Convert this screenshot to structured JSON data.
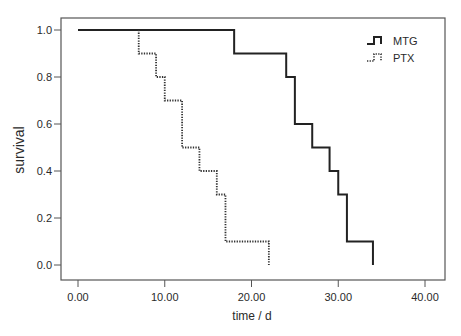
{
  "chart_data": {
    "type": "line",
    "subtype": "kaplan-meier-step",
    "title": "",
    "xlabel": "time / d",
    "ylabel": "survival",
    "xlim": [
      0,
      40
    ],
    "ylim": [
      0,
      1.0
    ],
    "x_ticks": [
      0,
      10,
      20,
      30,
      40
    ],
    "x_tick_labels": [
      "0.00",
      "10.00",
      "20.00",
      "30.00",
      "40.00"
    ],
    "y_ticks": [
      0,
      0.2,
      0.4,
      0.6,
      0.8,
      1.0
    ],
    "y_tick_labels": [
      "0.0",
      "0.2",
      "0.4",
      "0.6",
      "0.8",
      "1.0"
    ],
    "grid": false,
    "legend_position": "upper right",
    "series": [
      {
        "name": "MTG",
        "style": "solid",
        "color": "#222222",
        "start_x": 0,
        "steps": [
          {
            "x": 18,
            "y": 0.9
          },
          {
            "x": 24,
            "y": 0.8
          },
          {
            "x": 25,
            "y": 0.6
          },
          {
            "x": 27,
            "y": 0.5
          },
          {
            "x": 29,
            "y": 0.4
          },
          {
            "x": 30,
            "y": 0.3
          },
          {
            "x": 31,
            "y": 0.1
          },
          {
            "x": 34,
            "y": 0.0
          }
        ]
      },
      {
        "name": "PTX",
        "style": "dotted",
        "color": "#333333",
        "start_x": 7,
        "steps": [
          {
            "x": 7,
            "y": 0.9
          },
          {
            "x": 9,
            "y": 0.8
          },
          {
            "x": 10,
            "y": 0.7
          },
          {
            "x": 12,
            "y": 0.5
          },
          {
            "x": 14,
            "y": 0.4
          },
          {
            "x": 16,
            "y": 0.3
          },
          {
            "x": 17,
            "y": 0.1
          },
          {
            "x": 22,
            "y": 0.0
          }
        ]
      }
    ]
  },
  "legend": {
    "items": [
      {
        "label": "MTG"
      },
      {
        "label": "PTX"
      }
    ]
  }
}
